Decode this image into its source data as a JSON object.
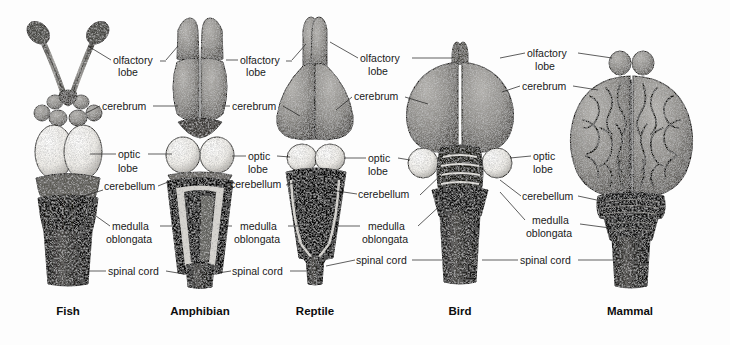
{
  "figure": {
    "background_color": "#fdfdfd",
    "ink_color": "#1a1a1a",
    "cerebrum_gray": "#8a8a8a",
    "optic_lobe_fill": "#f2f0ec",
    "medulla_dark": "#141414"
  },
  "label_text": {
    "olfactory_lobe_line1": "olfactory",
    "olfactory_lobe_line2": "lobe",
    "cerebrum": "cerebrum",
    "optic_lobe_line1": "optic",
    "optic_lobe_line2": "lobe",
    "cerebellum": "cerebellum",
    "medulla_line1": "medulla",
    "medulla_line2": "oblongata",
    "spinal_cord": "spinal cord"
  },
  "panels": [
    {
      "id": "fish",
      "species": "Fish",
      "center_x": 68
    },
    {
      "id": "amphibian",
      "species": "Amphibian",
      "center_x": 200
    },
    {
      "id": "reptile",
      "species": "Reptile",
      "center_x": 315
    },
    {
      "id": "bird",
      "species": "Bird",
      "center_x": 460
    },
    {
      "id": "mammal",
      "species": "Mammal",
      "center_x": 630
    }
  ],
  "label_columns": [
    {
      "id": "col-1",
      "serves": [
        "fish",
        "amphibian"
      ]
    },
    {
      "id": "col-2",
      "serves": [
        "amphibian",
        "reptile"
      ]
    },
    {
      "id": "col-3",
      "serves": [
        "reptile",
        "bird"
      ]
    },
    {
      "id": "col-4",
      "serves": [
        "bird",
        "mammal"
      ]
    }
  ],
  "parts": [
    "olfactory lobe",
    "cerebrum",
    "optic lobe",
    "cerebellum",
    "medulla oblongata",
    "spinal cord"
  ]
}
